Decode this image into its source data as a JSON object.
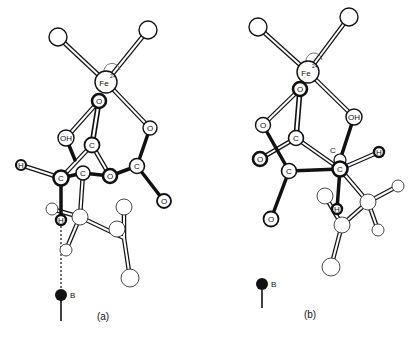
{
  "figure": {
    "panels": [
      {
        "id": "a",
        "caption": "(a)",
        "labels": {
          "fe": "Fe",
          "fe_charge": "2+",
          "o_top": "O",
          "oh": "OH",
          "o_right": "O",
          "c_upper": "C",
          "h_left": "H",
          "c_left": "C",
          "c_mid": "C",
          "o_mid": "O",
          "c_right": "C",
          "o_bottom": "O",
          "h_bottom": "H",
          "base": "B"
        }
      },
      {
        "id": "b",
        "caption": "(b)",
        "labels": {
          "fe": "Fe",
          "fe_charge": "2+",
          "o_top": "O",
          "o_left": "O",
          "oh": "OH",
          "c_upper": "C",
          "o_far_left": "O",
          "c_small": "C",
          "c_right": "C",
          "h_right": "H",
          "c_lower": "C",
          "o_bottom": "O",
          "h_bottom": "H",
          "base": "B"
        }
      }
    ],
    "colors": {
      "ink": "#111111",
      "background": "#ffffff",
      "atom_fill": "#ffffff",
      "base_fill": "#111111"
    }
  }
}
